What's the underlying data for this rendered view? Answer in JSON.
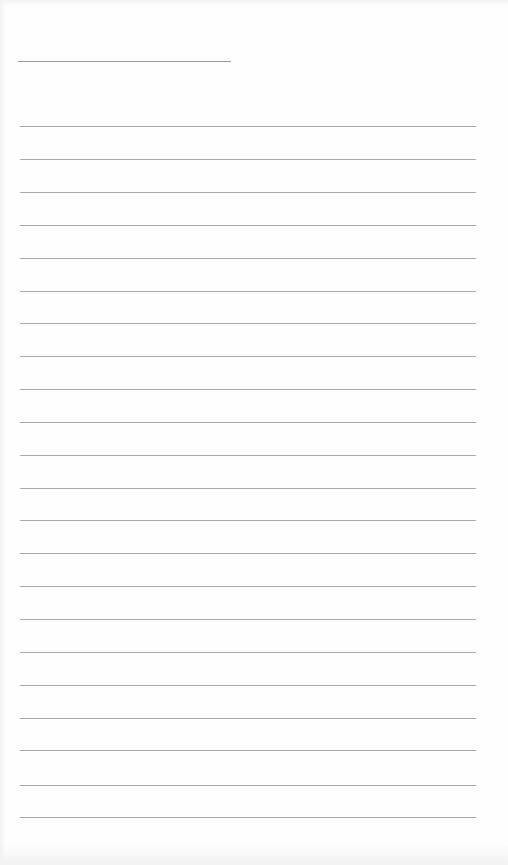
{
  "document": {
    "type": "lined-writing-sheet",
    "header_line": {
      "text": ""
    },
    "ruled_lines": [
      {
        "text": ""
      },
      {
        "text": ""
      },
      {
        "text": ""
      },
      {
        "text": ""
      },
      {
        "text": ""
      },
      {
        "text": ""
      },
      {
        "text": ""
      },
      {
        "text": ""
      },
      {
        "text": ""
      },
      {
        "text": ""
      },
      {
        "text": ""
      },
      {
        "text": ""
      },
      {
        "text": ""
      },
      {
        "text": ""
      },
      {
        "text": ""
      },
      {
        "text": ""
      },
      {
        "text": ""
      },
      {
        "text": ""
      },
      {
        "text": ""
      },
      {
        "text": ""
      },
      {
        "text": ""
      },
      {
        "text": ""
      }
    ],
    "colors": {
      "paper": "#fefefe",
      "rule": "#a8a8a8"
    }
  }
}
